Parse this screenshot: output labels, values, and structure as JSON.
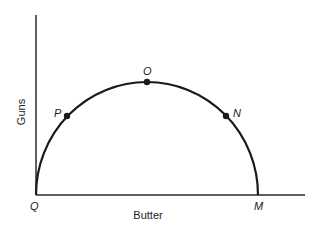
{
  "diagram": {
    "axes": {
      "x_label": "Butter",
      "y_label": "Guns"
    },
    "points": [
      {
        "id": "Q",
        "label": "Q"
      },
      {
        "id": "P",
        "label": "P"
      },
      {
        "id": "O",
        "label": "O"
      },
      {
        "id": "N",
        "label": "N"
      },
      {
        "id": "M",
        "label": "M"
      }
    ],
    "colors": {
      "line": "#1a1a1a",
      "background": "#ffffff"
    }
  }
}
